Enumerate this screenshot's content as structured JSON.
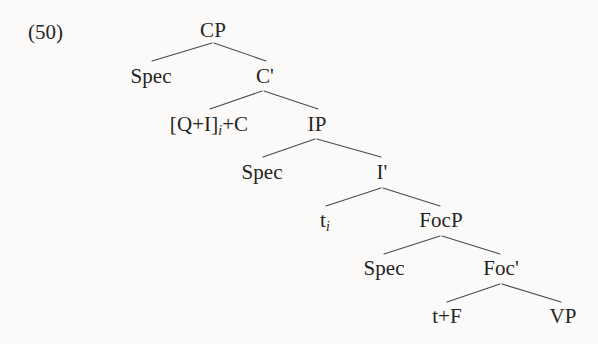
{
  "example": {
    "number": "(50)"
  },
  "tree": {
    "nodes": {
      "cp": "CP",
      "spec_cp": "Spec",
      "c_bar": "C'",
      "head_c_pre": "[Q+I]",
      "head_c_sub": "i",
      "head_c_post": "+C",
      "ip": "IP",
      "spec_ip": "Spec",
      "i_bar": "I'",
      "trace_pre": "t",
      "trace_sub": "i",
      "focp": "FocP",
      "spec_focp": "Spec",
      "foc_bar": "Foc'",
      "t_plus_f": "t+F",
      "vp": "VP"
    },
    "colors": {
      "line": "#4a4a4a",
      "text": "#242424",
      "background": "#fbfaf8"
    }
  }
}
